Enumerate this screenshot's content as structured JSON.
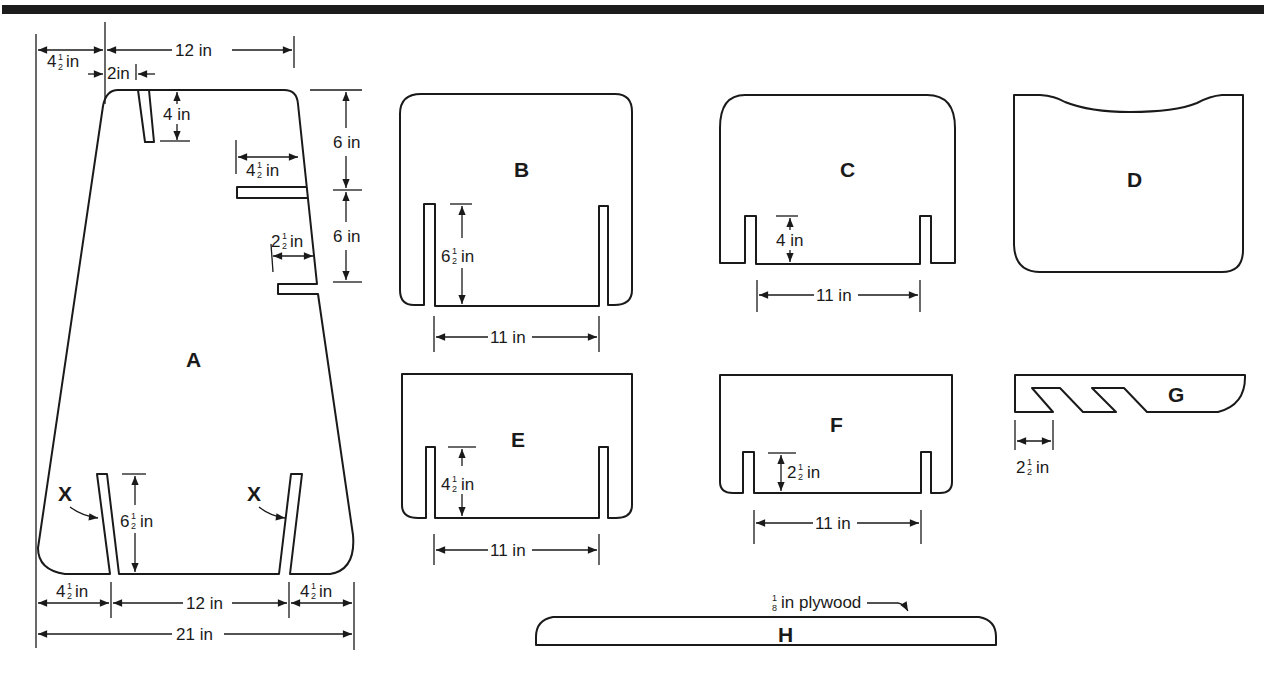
{
  "diagram": {
    "material_note": "1/8 in plywood",
    "parts": [
      {
        "id": "A",
        "label": "A",
        "shape": "trapezoid with rounded corners",
        "dimensions": {
          "top_offset_left": "4½ in",
          "top_width": "12 in",
          "slot_offset": "2in",
          "top_slot_depth": "4 in",
          "side_spacing_upper": "6 in",
          "side_spacing_lower": "6 in",
          "side_slot_upper_length": "4½ in",
          "side_slot_lower_length": "2½in",
          "bottom_slot_height": "6½ in",
          "bottom_left": "4½ in",
          "bottom_middle": "12 in",
          "bottom_right": "4½ in",
          "bottom_total": "21 in"
        },
        "callouts": [
          "X",
          "X"
        ]
      },
      {
        "id": "B",
        "label": "B",
        "dimensions": {
          "slot_height": "6½ in",
          "slot_spacing": "11 in"
        }
      },
      {
        "id": "C",
        "label": "C",
        "dimensions": {
          "slot_height": "4 in",
          "slot_spacing": "11 in"
        }
      },
      {
        "id": "D",
        "label": "D",
        "dimensions": {}
      },
      {
        "id": "E",
        "label": "E",
        "dimensions": {
          "slot_height": "4½ in",
          "slot_spacing": "11 in"
        }
      },
      {
        "id": "F",
        "label": "F",
        "dimensions": {
          "slot_height": "2½ in",
          "slot_spacing": "11 in"
        }
      },
      {
        "id": "G",
        "label": "G",
        "dimensions": {
          "notch_width": "2½ in"
        }
      },
      {
        "id": "H",
        "label": "H",
        "dimensions": {}
      }
    ]
  },
  "text": {
    "a_top_left": "4",
    "a_top_12": "12 in",
    "a_2in": "2in",
    "a_4in": "4 in",
    "a_6in_upper": "6 in",
    "a_6in_lower": "6 in",
    "a_45_side": "4",
    "a_25_side": "2",
    "a_65": "6",
    "a_bot_45_left": "4",
    "a_bot_12": "12 in",
    "a_bot_45_right": "4",
    "a_bot_21": "21 in",
    "x_left": "X",
    "x_right": "X",
    "in": "in",
    "half_num": "1",
    "half_den": "2",
    "eighth_num": "1",
    "eighth_den": "8",
    "b_slot": "6",
    "b_11": "11 in",
    "c_slot": "4 in",
    "c_11": "11 in",
    "e_slot": "4",
    "e_11": "11 in",
    "f_slot": "2",
    "f_11": "11 in",
    "g_notch": "2",
    "h_note": "in plywood",
    "label_a": "A",
    "label_b": "B",
    "label_c": "C",
    "label_d": "D",
    "label_e": "E",
    "label_f": "F",
    "label_g": "G",
    "label_h": "H"
  }
}
